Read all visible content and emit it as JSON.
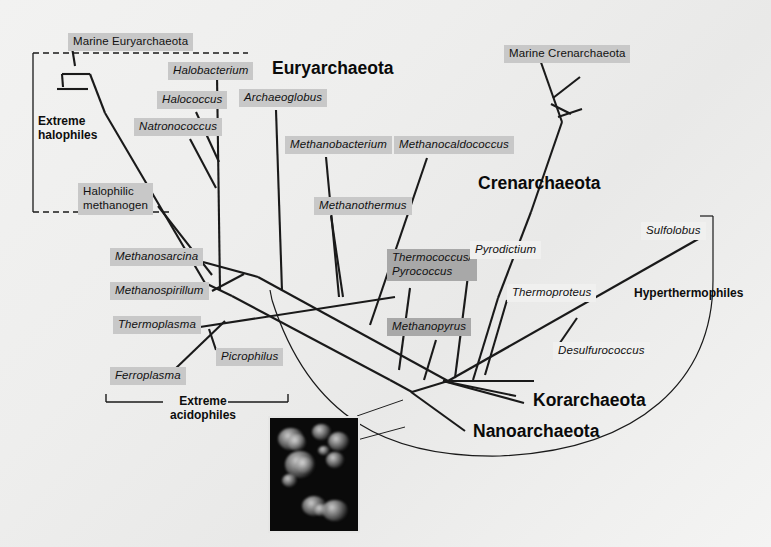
{
  "figure": {
    "type": "phylogenetic-tree",
    "domain_name": "Archaea",
    "background_color": "#efefee",
    "line_color": "#1a1a1a",
    "label_box_color": "#c8c8c8",
    "label_box_color_dark": "#a8a8a8"
  },
  "major_groups": [
    {
      "id": "euryarchaeota",
      "label": "Euryarchaeota"
    },
    {
      "id": "crenarchaeota",
      "label": "Crenarchaeota"
    },
    {
      "id": "korarchaeota",
      "label": "Korarchaeota"
    },
    {
      "id": "nanoarchaeota",
      "label": "Nanoarchaeota"
    }
  ],
  "physiology_brackets": [
    {
      "id": "extreme-halophiles",
      "label": "Extreme\nhalophiles",
      "style": "dashed"
    },
    {
      "id": "extreme-acidophiles",
      "label": "Extreme\nacidophiles",
      "style": "solid"
    },
    {
      "id": "hyperthermophiles",
      "label": "Hyperthermophiles",
      "style": "curved"
    }
  ],
  "taxa": [
    {
      "id": "marine-euryarchaeota",
      "label": "Marine Euryarchaeota",
      "italic": false,
      "box": "light",
      "group": "euryarchaeota"
    },
    {
      "id": "halobacterium",
      "label": "Halobacterium",
      "italic": true,
      "box": "light",
      "group": "euryarchaeota"
    },
    {
      "id": "halococcus",
      "label": "Halococcus",
      "italic": true,
      "box": "light",
      "group": "euryarchaeota"
    },
    {
      "id": "natronococcus",
      "label": "Natronococcus",
      "italic": true,
      "box": "light",
      "group": "euryarchaeota"
    },
    {
      "id": "archaeoglobus",
      "label": "Archaeoglobus",
      "italic": true,
      "box": "light",
      "group": "euryarchaeota"
    },
    {
      "id": "halophilic-methanogen",
      "label": "Halophilic\nmethanogen",
      "italic": false,
      "box": "light",
      "group": "euryarchaeota"
    },
    {
      "id": "methanobacterium",
      "label": "Methanobacterium",
      "italic": true,
      "box": "light",
      "group": "euryarchaeota"
    },
    {
      "id": "methanocaldococcus",
      "label": "Methanocaldococcus",
      "italic": true,
      "box": "light",
      "group": "euryarchaeota"
    },
    {
      "id": "methanothermus",
      "label": "Methanothermus",
      "italic": true,
      "box": "light",
      "group": "euryarchaeota"
    },
    {
      "id": "methanosarcina",
      "label": "Methanosarcina",
      "italic": true,
      "box": "light",
      "group": "euryarchaeota"
    },
    {
      "id": "methanospirillum",
      "label": "Methanospirillum",
      "italic": true,
      "box": "light",
      "group": "euryarchaeota"
    },
    {
      "id": "thermoplasma",
      "label": "Thermoplasma",
      "italic": true,
      "box": "light",
      "group": "euryarchaeota"
    },
    {
      "id": "picrophilus",
      "label": "Picrophilus",
      "italic": true,
      "box": "light",
      "group": "euryarchaeota"
    },
    {
      "id": "ferroplasma",
      "label": "Ferroplasma",
      "italic": true,
      "box": "light",
      "group": "euryarchaeota"
    },
    {
      "id": "thermococcus-pyrococcus",
      "label": "Thermococcus/\nPyrococcus",
      "italic": true,
      "box": "dark",
      "group": "euryarchaeota"
    },
    {
      "id": "methanopyrus",
      "label": "Methanopyrus",
      "italic": true,
      "box": "dark",
      "group": "euryarchaeota"
    },
    {
      "id": "marine-crenarchaeota",
      "label": "Marine Crenarchaeota",
      "italic": false,
      "box": "light",
      "group": "crenarchaeota"
    },
    {
      "id": "pyrodictium",
      "label": "Pyrodictium",
      "italic": true,
      "box": "none",
      "group": "crenarchaeota"
    },
    {
      "id": "thermoproteus",
      "label": "Thermoproteus",
      "italic": true,
      "box": "none",
      "group": "crenarchaeota"
    },
    {
      "id": "desulfurococcus",
      "label": "Desulfurococcus",
      "italic": true,
      "box": "none",
      "group": "crenarchaeota"
    },
    {
      "id": "sulfolobus",
      "label": "Sulfolobus",
      "italic": true,
      "box": "none",
      "group": "crenarchaeota"
    }
  ],
  "inset": {
    "id": "micrograph-inset",
    "description": "fluorescence micrograph",
    "background": "#0a0a0a"
  }
}
